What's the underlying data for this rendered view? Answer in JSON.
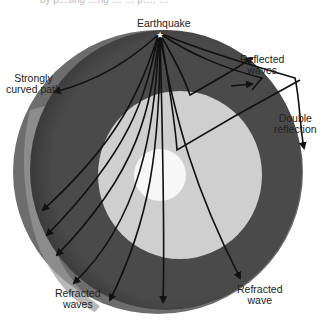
{
  "figure": {
    "type": "cross-section diagram"
  },
  "labels": {
    "top_cut_text": "by p…ting …ng … … p…, …",
    "earthquake": "Earthquake",
    "strongly_curved_path": [
      "Strongly",
      "curved path"
    ],
    "reflected_waves": [
      "Reflected",
      "waves"
    ],
    "double_reflection": [
      "Double",
      "reflection"
    ],
    "refracted_waves": [
      "Refracted",
      "waves"
    ],
    "refracted_wave": [
      "Refracted",
      "wave"
    ]
  },
  "colors": {
    "mantle": "#4a4a4a",
    "outer_core": "#cfcfcf",
    "inner_core": "#f7f7f7",
    "crust_edge": "#8a8a8a",
    "paths": "#111111"
  }
}
